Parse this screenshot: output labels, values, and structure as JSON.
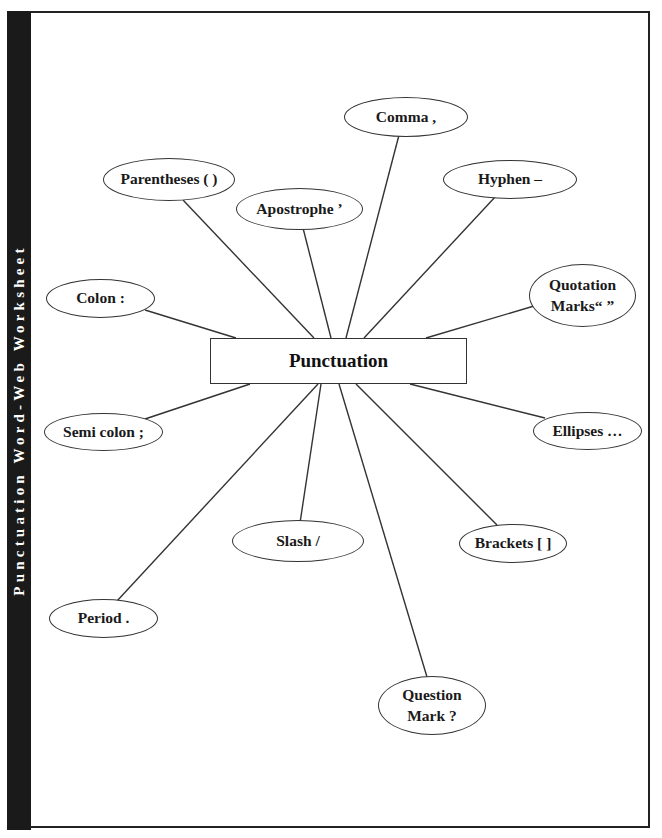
{
  "worksheet": {
    "title": "Punctuation Word-Web Worksheet",
    "center_label": "Punctuation"
  },
  "nodes": [
    {
      "id": "comma",
      "label": "Comma ,"
    },
    {
      "id": "hyphen",
      "label": "Hyphen –"
    },
    {
      "id": "parentheses",
      "label": "Parentheses ( )"
    },
    {
      "id": "apostrophe",
      "label": "Apostrophe ’"
    },
    {
      "id": "quotation-marks",
      "label_line1": "Quotation",
      "label_line2": "Marks“ ”"
    },
    {
      "id": "colon",
      "label": "Colon :"
    },
    {
      "id": "semicolon",
      "label": "Semi colon ;"
    },
    {
      "id": "ellipses",
      "label": "Ellipses …"
    },
    {
      "id": "slash",
      "label": "Slash /"
    },
    {
      "id": "brackets",
      "label": "Brackets [ ]"
    },
    {
      "id": "period",
      "label": "Period ."
    },
    {
      "id": "question-mark",
      "label_line1": "Question",
      "label_line2": "Mark ?"
    }
  ],
  "colors": {
    "sidebar": "#1a1a1a",
    "line": "#333333",
    "text": "#1a1a1a",
    "background": "#ffffff"
  }
}
